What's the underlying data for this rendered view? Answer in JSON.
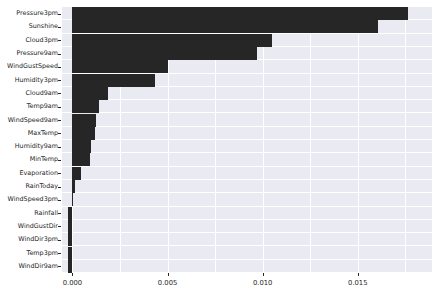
{
  "chart_data": {
    "type": "bar",
    "orientation": "horizontal",
    "title": "",
    "xlabel": "",
    "ylabel": "",
    "categories": [
      "Pressure3pm",
      "Sunshine",
      "Cloud3pm",
      "Pressure9am",
      "WindGustSpeed",
      "Humidity3pm",
      "Cloud9am",
      "Temp9am",
      "WindSpeed9am",
      "MaxTemp",
      "Humidity9am",
      "MinTemp",
      "Evaporation",
      "RainToday",
      "WindSpeed3pm",
      "Rainfall",
      "WindGustDir",
      "WindDir3pm",
      "Temp3pm",
      "WindDir9am"
    ],
    "values": [
      0.01765,
      0.01605,
      0.01048,
      0.00968,
      0.005,
      0.00436,
      0.00189,
      0.00142,
      0.00126,
      0.00116,
      0.001,
      0.00092,
      0.00047,
      0.00011,
      0.0,
      -0.00021,
      -0.00021,
      -0.00021,
      -0.00021,
      -0.00026
    ],
    "xticks": [
      0.0,
      0.005,
      0.01,
      0.015
    ],
    "xtick_labels": [
      "0.000",
      "0.005",
      "0.010",
      "0.015"
    ],
    "xlim": [
      -0.00055,
      0.0189
    ],
    "grid": true,
    "grid_axis": "both",
    "legend": null,
    "bar_color": "#262626",
    "plot_background": "#eaeaf2",
    "gridline_color": "#ffffff",
    "figure_background": "#ffffff"
  }
}
